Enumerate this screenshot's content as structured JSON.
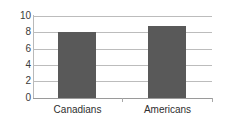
{
  "chart_data": {
    "type": "bar",
    "title": "",
    "subtitle": "",
    "xlabel": "",
    "ylabel": "",
    "categories": [
      "Canadians",
      "Americans"
    ],
    "values": [
      8.0,
      8.8
    ],
    "series": [
      {
        "name": "",
        "values": [
          8.0,
          8.8
        ]
      }
    ],
    "ylim": [
      0,
      10
    ],
    "xlim": null,
    "y_ticks": [
      0,
      2,
      4,
      6,
      8,
      10
    ],
    "y_tick_labels": [
      "0",
      "2",
      "4",
      "6",
      "8",
      "10"
    ],
    "grid": true,
    "grid_axis": "y",
    "legend": false,
    "legend_position": "none",
    "annotations": [],
    "colors": {
      "bar_fill": "#595959",
      "gridline": "#bcbcbc",
      "axis_line": "#9a9a9a",
      "tick_label": "#3a3a3a",
      "category_label": "#2e2e2e",
      "background": "#ffffff"
    }
  }
}
